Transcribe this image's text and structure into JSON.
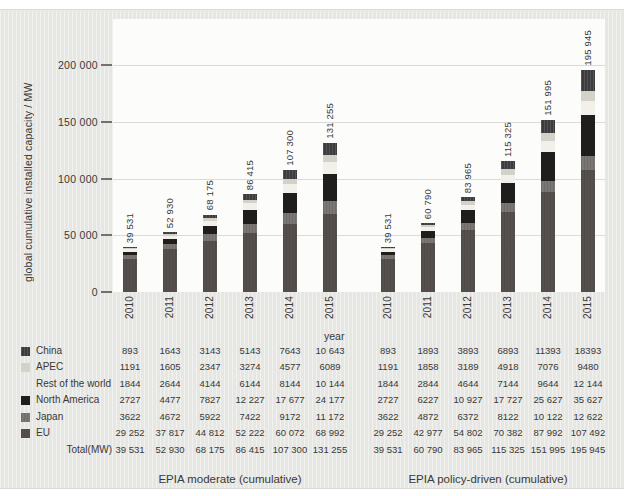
{
  "chart_data": {
    "type": "bar",
    "stacked": true,
    "ylabel": "global cumulative installed capacity / MW",
    "xlabel": "year",
    "ylim": [
      0,
      200000
    ],
    "grid": true,
    "yticks": [
      {
        "value": 0,
        "label": "0"
      },
      {
        "value": 50000,
        "label": "50 000"
      },
      {
        "value": 100000,
        "label": "100 000"
      },
      {
        "value": 150000,
        "label": "150 000"
      },
      {
        "value": 200000,
        "label": "200 000"
      }
    ],
    "stack_order_bottom_to_top": [
      "EU",
      "Japan",
      "North America",
      "Rest of the world",
      "APEC",
      "China"
    ],
    "colors": {
      "China": "#3c3b3d",
      "APEC": "#d3d1c8",
      "Rest of the world": "#f2f0ea",
      "North America": "#1f1e1d",
      "Japan": "#7a7774",
      "EU": "#55504e"
    },
    "groups": [
      {
        "name": "EPIA moderate (cumulative)",
        "categories": [
          "2010",
          "2011",
          "2012",
          "2013",
          "2014",
          "2015"
        ],
        "series": [
          {
            "name": "China",
            "values": [
              893,
              1643,
              3143,
              5143,
              7643,
              10643
            ]
          },
          {
            "name": "APEC",
            "values": [
              1191,
              1605,
              2347,
              3274,
              4577,
              6089
            ]
          },
          {
            "name": "Rest of the world",
            "values": [
              1844,
              2644,
              4144,
              6144,
              8144,
              10144
            ]
          },
          {
            "name": "North America",
            "values": [
              2727,
              4477,
              7827,
              12227,
              17677,
              24177
            ]
          },
          {
            "name": "Japan",
            "values": [
              3622,
              4672,
              5922,
              7422,
              9172,
              11172
            ]
          },
          {
            "name": "EU",
            "values": [
              29252,
              37817,
              44812,
              52222,
              60072,
              68992
            ]
          }
        ],
        "totals_display": [
          "39 531",
          "52 930",
          "68 175",
          "86 415",
          "107 300",
          "131 255"
        ]
      },
      {
        "name": "EPIA policy-driven (cumulative)",
        "categories": [
          "2010",
          "2011",
          "2012",
          "2013",
          "2014",
          "2015"
        ],
        "series": [
          {
            "name": "China",
            "values": [
              893,
              1893,
              3893,
              6893,
              11393,
              18393
            ]
          },
          {
            "name": "APEC",
            "values": [
              1191,
              1858,
              3189,
              4918,
              7076,
              9480
            ]
          },
          {
            "name": "Rest of the world",
            "values": [
              1844,
              2844,
              4644,
              7144,
              9644,
              12144
            ]
          },
          {
            "name": "North America",
            "values": [
              2727,
              6227,
              10927,
              17727,
              25627,
              35627
            ]
          },
          {
            "name": "Japan",
            "values": [
              3622,
              4872,
              6372,
              8122,
              10122,
              12622
            ]
          },
          {
            "name": "EU",
            "values": [
              29252,
              42977,
              54802,
              70382,
              87992,
              107492
            ]
          }
        ],
        "totals_display": [
          "39 531",
          "60 790",
          "83 965",
          "115 325",
          "151 995",
          "195 945"
        ]
      }
    ]
  },
  "table": {
    "rows": [
      {
        "label": "China",
        "moderate": [
          "893",
          "1643",
          "3143",
          "5143",
          "7643",
          "10 643"
        ],
        "policy": [
          "893",
          "1893",
          "3893",
          "6893",
          "11393",
          "18393"
        ]
      },
      {
        "label": "APEC",
        "moderate": [
          "1191",
          "1605",
          "2347",
          "3274",
          "4577",
          "6089"
        ],
        "policy": [
          "1191",
          "1858",
          "3189",
          "4918",
          "7076",
          "9480"
        ]
      },
      {
        "label": "Rest of the world",
        "moderate": [
          "1844",
          "2644",
          "4144",
          "6144",
          "8144",
          "10 144"
        ],
        "policy": [
          "1844",
          "2844",
          "4644",
          "7144",
          "9644",
          "12 144"
        ]
      },
      {
        "label": "North America",
        "moderate": [
          "2727",
          "4477",
          "7827",
          "12 227",
          "17 677",
          "24 177"
        ],
        "policy": [
          "2727",
          "6227",
          "10 927",
          "17 727",
          "25 627",
          "35 627"
        ]
      },
      {
        "label": "Japan",
        "moderate": [
          "3622",
          "4672",
          "5922",
          "7422",
          "9172",
          "11 172"
        ],
        "policy": [
          "3622",
          "4872",
          "6372",
          "8122",
          "10 122",
          "12 622"
        ]
      },
      {
        "label": "EU",
        "moderate": [
          "29 252",
          "37 817",
          "44 812",
          "52 222",
          "60 072",
          "68 992"
        ],
        "policy": [
          "29 252",
          "42 977",
          "54 802",
          "70 382",
          "87 992",
          "107 492"
        ]
      }
    ],
    "total_row": {
      "label": "Total(MW)",
      "moderate": [
        "39 531",
        "52 930",
        "68 175",
        "86 415",
        "107 300",
        "131 255"
      ],
      "policy": [
        "39 531",
        "60 790",
        "83 965",
        "115 325",
        "151 995",
        "195 945"
      ]
    }
  }
}
